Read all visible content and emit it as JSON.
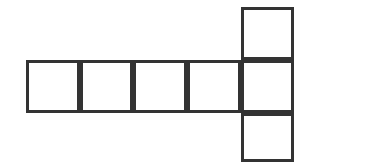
{
  "figure": {
    "name": "cube-net",
    "kind": "geometric-net-diagram",
    "background_color": "#ffffff",
    "stroke_color": "#333333",
    "fill_color": "#ffffff",
    "stroke_width": 3,
    "square_size": 53,
    "square_count": 6,
    "canvas": {
      "width": 390,
      "height": 165
    },
    "grid": {
      "vertical_lines_x": [
        26,
        80,
        133,
        187,
        241,
        294
      ],
      "horizontal_lines_y": [
        7,
        60,
        113,
        162
      ]
    },
    "squares": [
      {
        "id": "square-top",
        "label": "",
        "x": 241,
        "y": 7,
        "w": 53,
        "h": 53,
        "row": "upper",
        "col": 5
      },
      {
        "id": "square-row-1",
        "label": "",
        "x": 26,
        "y": 60,
        "w": 54,
        "h": 53,
        "row": "middle",
        "col": 1
      },
      {
        "id": "square-row-2",
        "label": "",
        "x": 80,
        "y": 60,
        "w": 53,
        "h": 53,
        "row": "middle",
        "col": 2
      },
      {
        "id": "square-row-3",
        "label": "",
        "x": 133,
        "y": 60,
        "w": 54,
        "h": 53,
        "row": "middle",
        "col": 3
      },
      {
        "id": "square-row-4",
        "label": "",
        "x": 187,
        "y": 60,
        "w": 54,
        "h": 53,
        "row": "middle",
        "col": 4
      },
      {
        "id": "square-row-5",
        "label": "",
        "x": 241,
        "y": 60,
        "w": 53,
        "h": 53,
        "row": "middle",
        "col": 5
      },
      {
        "id": "square-bottom",
        "label": "",
        "x": 241,
        "y": 113,
        "w": 53,
        "h": 49,
        "row": "lower",
        "col": 5
      }
    ]
  }
}
